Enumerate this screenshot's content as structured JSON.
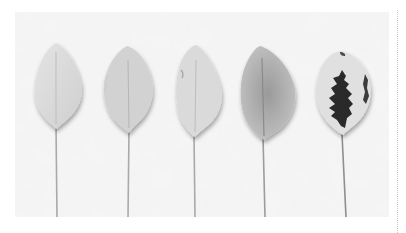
{
  "image": {
    "caption": "Five leaves arranged in a row, increasing in dark variegated pigmentation from left to right",
    "background_color": "#f1f1f1",
    "leaves": [
      {
        "id": 1,
        "fill": "#d9d9d9",
        "vein": "#bdbdbd",
        "pattern": "none"
      },
      {
        "id": 2,
        "fill": "#d3d3d3",
        "vein": "#b5b5b5",
        "pattern": "none"
      },
      {
        "id": 3,
        "fill": "#dcdcdc",
        "vein": "#bcbcbc",
        "pattern": "none"
      },
      {
        "id": 4,
        "fill": "#b9b9b9",
        "vein": "#8f8f8f",
        "pattern": "shaded-center"
      },
      {
        "id": 5,
        "fill": "#dedede",
        "vein": "#2a2a2a",
        "pattern": "dark-variegated-center"
      }
    ]
  }
}
